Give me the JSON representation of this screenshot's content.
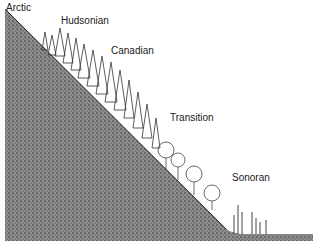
{
  "diagram": {
    "zones": [
      {
        "label": "Arctic",
        "x": 6,
        "y": 2
      },
      {
        "label": "Hudsonian",
        "x": 61,
        "y": 15
      },
      {
        "label": "Canadian",
        "x": 111,
        "y": 45
      },
      {
        "label": "Transition",
        "x": 170,
        "y": 112
      },
      {
        "label": "Sonoran",
        "x": 232,
        "y": 172
      }
    ],
    "colors": {
      "ground": "#777777",
      "trees": "#333333",
      "background": "#ffffff"
    }
  }
}
